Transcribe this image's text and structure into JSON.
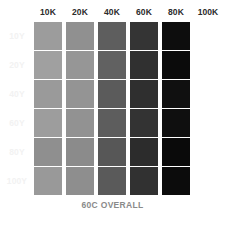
{
  "caption": "60C OVERALL",
  "background_color": "#ffffff",
  "header_text_color": "#2b2b2b",
  "row_label_color": "#f2f2f2",
  "caption_color": "#8a8a8a",
  "chart_data": {
    "type": "heatmap",
    "title": "60C OVERALL",
    "xlabel": "",
    "ylabel": "",
    "grid": false,
    "legend": "none",
    "columns": [
      "10K",
      "20K",
      "40K",
      "60K",
      "80K",
      "100K"
    ],
    "rows": [
      "10Y",
      "20Y",
      "40Y",
      "60Y",
      "80Y",
      "100Y"
    ],
    "column_values": [
      10,
      20,
      40,
      60,
      80,
      100
    ],
    "row_values": [
      10,
      20,
      40,
      60,
      80,
      100
    ],
    "cells": [
      [
        {
          "label": "10K/10Y",
          "value": 10,
          "color": "#9c9c9c",
          "empty": false
        },
        {
          "label": "20K/10Y",
          "value": 20,
          "color": "#909090",
          "empty": false
        },
        {
          "label": "40K/10Y",
          "value": 40,
          "color": "#5e5e5e",
          "empty": false
        },
        {
          "label": "60K/10Y",
          "value": 60,
          "color": "#343434",
          "empty": false
        },
        {
          "label": "80K/10Y",
          "value": 80,
          "color": "#0d0d0d",
          "empty": false
        },
        {
          "label": "100K/10Y",
          "value": null,
          "color": "#ffffff",
          "empty": true
        }
      ],
      [
        {
          "label": "10K/20Y",
          "value": 10,
          "color": "#a0a0a0",
          "empty": false
        },
        {
          "label": "20K/20Y",
          "value": 20,
          "color": "#969696",
          "empty": false
        },
        {
          "label": "40K/20Y",
          "value": 40,
          "color": "#616161",
          "empty": false
        },
        {
          "label": "60K/20Y",
          "value": 60,
          "color": "#303030",
          "empty": false
        },
        {
          "label": "80K/20Y",
          "value": 80,
          "color": "#0b0b0b",
          "empty": false
        },
        {
          "label": "100K/20Y",
          "value": null,
          "color": "#ffffff",
          "empty": true
        }
      ],
      [
        {
          "label": "10K/40Y",
          "value": 10,
          "color": "#9a9a9a",
          "empty": false
        },
        {
          "label": "20K/40Y",
          "value": 20,
          "color": "#949494",
          "empty": false
        },
        {
          "label": "40K/40Y",
          "value": 40,
          "color": "#5b5b5b",
          "empty": false
        },
        {
          "label": "60K/40Y",
          "value": 60,
          "color": "#2f2f2f",
          "empty": false
        },
        {
          "label": "80K/40Y",
          "value": 80,
          "color": "#101010",
          "empty": false
        },
        {
          "label": "100K/40Y",
          "value": null,
          "color": "#ffffff",
          "empty": true
        }
      ],
      [
        {
          "label": "10K/60Y",
          "value": 10,
          "color": "#9d9d9d",
          "empty": false
        },
        {
          "label": "20K/60Y",
          "value": 20,
          "color": "#929292",
          "empty": false
        },
        {
          "label": "40K/60Y",
          "value": 40,
          "color": "#5d5d5d",
          "empty": false
        },
        {
          "label": "60K/60Y",
          "value": 60,
          "color": "#333333",
          "empty": false
        },
        {
          "label": "80K/60Y",
          "value": 80,
          "color": "#0f0f0f",
          "empty": false
        },
        {
          "label": "100K/60Y",
          "value": null,
          "color": "#ffffff",
          "empty": true
        }
      ],
      [
        {
          "label": "10K/80Y",
          "value": 10,
          "color": "#8f8f8f",
          "empty": false
        },
        {
          "label": "20K/80Y",
          "value": 20,
          "color": "#8b8b8b",
          "empty": false
        },
        {
          "label": "40K/80Y",
          "value": 40,
          "color": "#575757",
          "empty": false
        },
        {
          "label": "60K/80Y",
          "value": 60,
          "color": "#2c2c2c",
          "empty": false
        },
        {
          "label": "80K/80Y",
          "value": 80,
          "color": "#0a0a0a",
          "empty": false
        },
        {
          "label": "100K/80Y",
          "value": null,
          "color": "#ffffff",
          "empty": true
        }
      ],
      [
        {
          "label": "10K/100Y",
          "value": 10,
          "color": "#999999",
          "empty": false
        },
        {
          "label": "20K/100Y",
          "value": 20,
          "color": "#8e8e8e",
          "empty": false
        },
        {
          "label": "40K/100Y",
          "value": 40,
          "color": "#5a5a5a",
          "empty": false
        },
        {
          "label": "60K/100Y",
          "value": 60,
          "color": "#313131",
          "empty": false
        },
        {
          "label": "80K/100Y",
          "value": 80,
          "color": "#0c0c0c",
          "empty": false
        },
        {
          "label": "100K/100Y",
          "value": null,
          "color": "#ffffff",
          "empty": true
        }
      ]
    ]
  }
}
